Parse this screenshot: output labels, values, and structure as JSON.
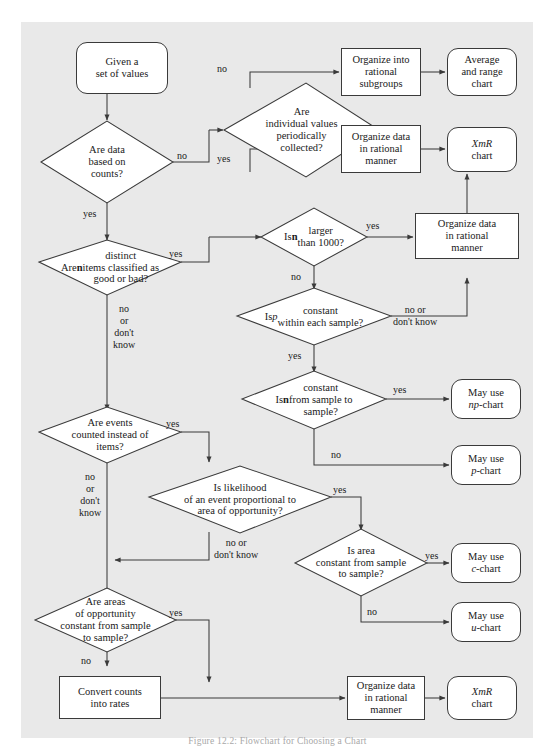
{
  "figure": {
    "caption": "Figure 12.2: Flowchart for Choosing a Chart",
    "panel_bg": "#e9e9e9",
    "stroke": "#3a3a3a",
    "text_color": "#1a1a1a"
  },
  "nodes": {
    "start": {
      "label": "Given a\nset of values",
      "shape": "terminator"
    },
    "q_counts": {
      "label": "Are data\nbased on\ncounts?",
      "shape": "diamond"
    },
    "q_individual": {
      "label": "Are\nindividual values\nperiodically\ncollected?",
      "shape": "diamond"
    },
    "p_subgroups": {
      "label": "Organize into\nrational\nsubgroups",
      "shape": "process"
    },
    "t_avg_range": {
      "label": "Average\nand range\nchart",
      "shape": "terminator"
    },
    "p_rational_top": {
      "label": "Organize data\nin rational\nmanner",
      "shape": "process"
    },
    "t_xmr_top": {
      "label": "XmR\nchart",
      "shape": "terminator",
      "italic_first_word": true
    },
    "q_distinct": {
      "label": "Are n distinct\nitems classified as\ngood or bad?",
      "shape": "diamond"
    },
    "q_n_larger": {
      "label": "Is n larger\nthan 1000?",
      "shape": "diamond"
    },
    "p_rational_mid": {
      "label": "Organize data\nin rational\nmanner",
      "shape": "process"
    },
    "q_p_constant": {
      "label": "Is p constant\nwithin each sample?",
      "shape": "diamond"
    },
    "q_n_constant": {
      "label": "Is n constant\nfrom sample to\nsample?",
      "shape": "diamond"
    },
    "t_np_chart": {
      "label": "May use\nnp-chart",
      "shape": "terminator"
    },
    "t_p_chart": {
      "label": "May use\np-chart",
      "shape": "terminator"
    },
    "q_events": {
      "label": "Are events\ncounted instead of\nitems?",
      "shape": "diamond"
    },
    "q_likelihood": {
      "label": "Is likelihood\nof an event proportional to\narea of opportunity?",
      "shape": "diamond"
    },
    "q_area_constant": {
      "label": "Is area\nconstant from sample\nto sample?",
      "shape": "diamond"
    },
    "t_c_chart": {
      "label": "May use\nc-chart",
      "shape": "terminator"
    },
    "t_u_chart": {
      "label": "May use\nu-chart",
      "shape": "terminator"
    },
    "q_areas_opportunity": {
      "label": "Are areas\nof opportunity\nconstant from sample\nto sample?",
      "shape": "diamond"
    },
    "p_convert": {
      "label": "Convert counts\ninto rates",
      "shape": "process"
    },
    "p_rational_bottom": {
      "label": "Organize data\nin rational\nmanner",
      "shape": "process"
    },
    "t_xmr_bottom": {
      "label": "XmR\nchart",
      "shape": "terminator",
      "italic_first_word": true
    }
  },
  "edge_labels": {
    "counts_no": "no",
    "counts_yes": "yes",
    "individual_no": "no",
    "individual_yes": "yes",
    "distinct_yes": "yes",
    "distinct_no": "no\nor\ndon't\nknow",
    "n_larger_yes": "yes",
    "n_larger_no": "no",
    "p_constant_nodk": "no or\ndon't know",
    "p_constant_yes": "yes",
    "n_constant_yes": "yes",
    "n_constant_no": "no",
    "events_yes": "yes",
    "events_no": "no\nor\ndon't\nknow",
    "likelihood_yes": "yes",
    "likelihood_nodk": "no or\ndon't know",
    "area_yes": "yes",
    "area_no": "no",
    "areas_opp_yes": "yes",
    "areas_opp_no": "no"
  }
}
